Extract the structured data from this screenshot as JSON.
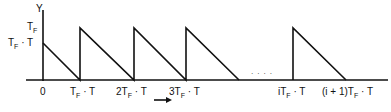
{
  "axis": {
    "y_label": "Y"
  },
  "y_ticks": [
    {
      "main": "T",
      "sub": "F",
      "rest": ""
    },
    {
      "main": "T",
      "sub": "F",
      "rest": " · T"
    }
  ],
  "x_ticks": [
    {
      "pre": "0",
      "main": "",
      "sub": "",
      "rest": ""
    },
    {
      "pre": "",
      "main": "T",
      "sub": "F",
      "rest": " · T"
    },
    {
      "pre": "2",
      "main": "T",
      "sub": "F",
      "rest": " · T"
    },
    {
      "pre": "3",
      "main": "T",
      "sub": "F",
      "rest": " · T"
    },
    {
      "pre": "i",
      "main": "T",
      "sub": "F",
      "rest": " · T"
    },
    {
      "pre": "(i + 1)",
      "main": "T",
      "sub": "F",
      "rest": " · T"
    }
  ],
  "ellipsis": "· · · ·",
  "colors": {
    "stroke": "#111111"
  }
}
